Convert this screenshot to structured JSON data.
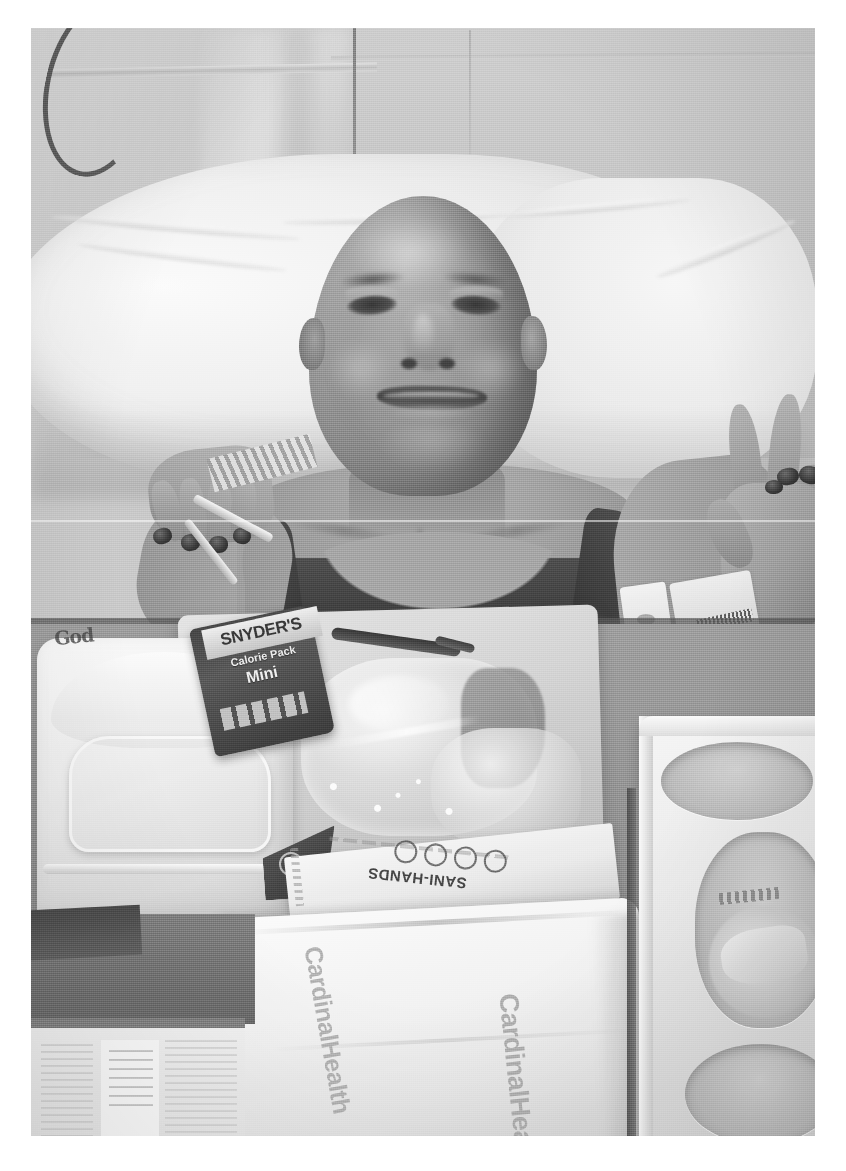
{
  "photo": {
    "kind": "photograph",
    "color_mode": "grayscale",
    "alt": "A smiling bald person lying in a hospital bed, raising a hand in a peace sign, with a meal tray in the foreground",
    "frame": {
      "margin_color": "#ffffff",
      "left": 31,
      "top": 28,
      "width": 784,
      "height": 1108
    }
  },
  "scene": {
    "setting": "hospital-room",
    "background_label": "hospital privacy curtain / wall",
    "bed_label": "hospital bed with white pillows and linens"
  },
  "subject": {
    "label": "patient",
    "expression": "smiling",
    "head": "bald",
    "gesture": "peace-sign",
    "garment": "dark sleeveless tank top",
    "nail_polish_color": "#2e2a26",
    "skin_tone_hex": "#9c948c"
  },
  "items": {
    "wall": "privacy-curtain",
    "cable": "iv-tubing",
    "pillow": "pillow",
    "clamshell": "styrofoam-food-container",
    "clamshell_handwriting": "God",
    "snack": {
      "brand": "SNYDER'S",
      "line2": "Calorie Pack",
      "line3": "Mini"
    },
    "wipe": {
      "brand": "SANI-HANDS",
      "prefix": "PDI"
    },
    "towel": {
      "brand_1": "CardinalHealth",
      "brand_2": "CardinalHealth"
    },
    "cuptray": "cup-holder-tray",
    "paper": "printed-paper",
    "utensil": "plastic-utensil",
    "wrapped_food": "plastic-wrapped-food",
    "wristbands": "hospital-id-wristbands"
  },
  "colors": {
    "page_background": "#ffffff",
    "wall": "#c4c4c4",
    "linen": "#f4f4f4",
    "tray_table": "#8e8e8e",
    "garment": "#342f2b"
  }
}
